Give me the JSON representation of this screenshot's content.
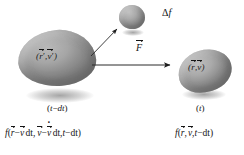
{
  "figure": {
    "type": "physics-diagram",
    "background_color": "#ffffff",
    "ink_color": "#141414"
  },
  "objects": {
    "initial_blob": {
      "name": "initial phase-space volume",
      "label_parts": {
        "open": "(",
        "r": "r",
        "prime1": "′",
        "comma": ",",
        "v": "v",
        "prime2": "′",
        "close": ")"
      },
      "time_label": "(t−dt)",
      "time_parts": {
        "open": "(",
        "t": "t",
        "minus": "−",
        "dt": "dt",
        "close": ")"
      },
      "fill_color": "#a6a6a6"
    },
    "final_blob": {
      "name": "final phase-space volume",
      "label_parts": {
        "open": "(",
        "r": "r",
        "comma": ",",
        "v": "v",
        "close": ")"
      },
      "time_label": "(t)",
      "time_parts": {
        "open": "(",
        "t": "t",
        "close": ")"
      },
      "fill_color": "#aaaaaa"
    },
    "small_blob": {
      "name": "change in distribution blob",
      "fill_color": "#ababab"
    }
  },
  "annotations": {
    "delta_f": {
      "delta": "Δ",
      "f": "f"
    },
    "force": {
      "symbol": "F"
    },
    "diagonal_arrow": {
      "name": "collision-scatter-arrow"
    },
    "horizontal_arrow": {
      "name": "force-arrow"
    }
  },
  "formulas": {
    "left": {
      "f": "f",
      "open": "(",
      "r": "r",
      "minus1": "−",
      "v1": "v",
      "dt1": "dt",
      "comma1": ",",
      "v2": "v",
      "minus2": "−",
      "vdot": "v",
      "dt2": "dt",
      "comma2": ",",
      "t": "t",
      "minus3": "−",
      "dt3": "dt",
      "close": ")",
      "plain": "f(r−v dt, v−v̇ dt, t−dt)"
    },
    "right": {
      "f": "f",
      "open": "(",
      "r": "r",
      "comma1": ",",
      "v": "v",
      "comma2": ",",
      "t": "t",
      "minus": "−",
      "dt": "dt",
      "close": ")",
      "plain": "f(r, v, t−dt)"
    }
  }
}
